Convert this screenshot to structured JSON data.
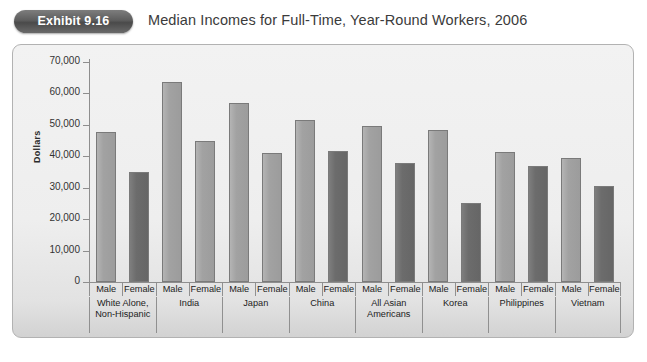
{
  "exhibit": {
    "badge_label": "Exhibit 9.16",
    "title": "Median Incomes for Full-Time, Year-Round Workers, 2006"
  },
  "chart_data": {
    "type": "bar",
    "title": "Median Incomes for Full-Time, Year-Round Workers, 2006",
    "xlabel": "",
    "ylabel": "Dollars",
    "ylim": [
      0,
      70000
    ],
    "ytick_labels": [
      "70,000",
      "60,000",
      "50,000",
      "40,000",
      "30,000",
      "20,000",
      "10,000",
      "0"
    ],
    "ytick_values": [
      70000,
      60000,
      50000,
      40000,
      30000,
      20000,
      10000,
      0
    ],
    "grid": false,
    "legend": "none",
    "series": [
      {
        "name": "Male",
        "color": "#a2a2a2",
        "values": [
          47800,
          63500,
          57000,
          51700,
          49500,
          48500,
          41300,
          39500
        ]
      },
      {
        "name": "Female",
        "color": "#6c6c6c",
        "values": [
          34900,
          45000,
          41000,
          41800,
          37900,
          25200,
          37000,
          30400
        ]
      }
    ],
    "categories": [
      "White Alone, Non-Hispanic",
      "India",
      "Japan",
      "China",
      "All Asian Americans",
      "Korea",
      "Philippines",
      "Vietnam"
    ],
    "groups": [
      {
        "label_lines": [
          "White Alone,",
          "Non-Hispanic"
        ],
        "bars": [
          {
            "sex": "Male",
            "value": 47800,
            "shade": "light"
          },
          {
            "sex": "Female",
            "value": 34900,
            "shade": "dark"
          }
        ]
      },
      {
        "label_lines": [
          "India"
        ],
        "bars": [
          {
            "sex": "Male",
            "value": 63500,
            "shade": "light"
          },
          {
            "sex": "Female",
            "value": 45000,
            "shade": "light"
          }
        ]
      },
      {
        "label_lines": [
          "Japan"
        ],
        "bars": [
          {
            "sex": "Male",
            "value": 57000,
            "shade": "light"
          },
          {
            "sex": "Female",
            "value": 41000,
            "shade": "light"
          }
        ]
      },
      {
        "label_lines": [
          "China"
        ],
        "bars": [
          {
            "sex": "Male",
            "value": 51700,
            "shade": "light"
          },
          {
            "sex": "Female",
            "value": 41800,
            "shade": "dark"
          }
        ]
      },
      {
        "label_lines": [
          "All Asian",
          "Americans"
        ],
        "bars": [
          {
            "sex": "Male",
            "value": 49500,
            "shade": "light"
          },
          {
            "sex": "Female",
            "value": 37900,
            "shade": "dark"
          }
        ]
      },
      {
        "label_lines": [
          "Korea"
        ],
        "bars": [
          {
            "sex": "Male",
            "value": 48500,
            "shade": "light"
          },
          {
            "sex": "Female",
            "value": 25200,
            "shade": "dark"
          }
        ]
      },
      {
        "label_lines": [
          "Philippines"
        ],
        "bars": [
          {
            "sex": "Male",
            "value": 41300,
            "shade": "light"
          },
          {
            "sex": "Female",
            "value": 37000,
            "shade": "dark"
          }
        ]
      },
      {
        "label_lines": [
          "Vietnam"
        ],
        "bars": [
          {
            "sex": "Male",
            "value": 39500,
            "shade": "light"
          },
          {
            "sex": "Female",
            "value": 30400,
            "shade": "dark"
          }
        ]
      }
    ]
  },
  "colors": {
    "bar_light": "#a2a2a2",
    "bar_dark": "#6c6c6c",
    "panel_bg": "#eeeeee",
    "panel_border": "#b2b2b2",
    "badge_bg": "#5d5d5d",
    "axis": "#8e8e8e"
  }
}
